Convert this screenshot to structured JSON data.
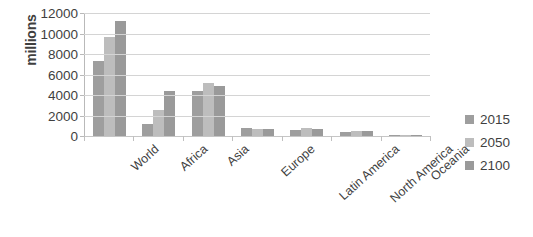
{
  "chart_data": {
    "type": "bar",
    "title": "",
    "subtitle": "",
    "xlabel": "",
    "ylabel": "millions",
    "ylim": [
      0,
      12000
    ],
    "ytick_step": 2000,
    "yticks": [
      "0",
      "2000",
      "4000",
      "6000",
      "8000",
      "10000",
      "12000"
    ],
    "grid": true,
    "legend_position": "right",
    "categories": [
      "World",
      "Africa",
      "Asia",
      "Europe",
      "Latin America",
      "North America",
      "Oceania"
    ],
    "series": [
      {
        "name": "2015",
        "color": "#9e9e9e",
        "values": [
          7300,
          1200,
          4400,
          740,
          630,
          360,
          40
        ]
      },
      {
        "name": "2050",
        "color": "#bdbdbd",
        "values": [
          9700,
          2500,
          5200,
          710,
          780,
          450,
          57
        ]
      },
      {
        "name": "2100",
        "color": "#9a9a9a",
        "values": [
          11200,
          4400,
          4900,
          650,
          720,
          500,
          70
        ]
      }
    ]
  }
}
